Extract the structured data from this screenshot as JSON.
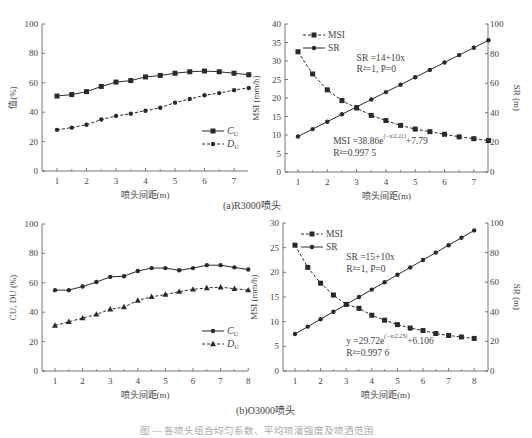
{
  "figure": {
    "caption_a": "(a)R3000喷头",
    "caption_b": "(b)O3000喷头",
    "caption_main": "图 — 各喷头组合均匀系数、平均喷灌强度及喷洒范围"
  },
  "chart_data": [
    {
      "id": "a-left",
      "type": "line",
      "panel": "(a)R3000喷头",
      "title": "",
      "xlabel": "喷头间距(m)",
      "ylabel": "值(%)",
      "xlim": [
        0.5,
        7.5
      ],
      "ylim": [
        0,
        100
      ],
      "xticks": [
        1,
        2,
        3,
        4,
        5,
        6,
        7
      ],
      "yticks": [
        0,
        20,
        40,
        60,
        80,
        100
      ],
      "grid": false,
      "legend_position": "lower right",
      "x": [
        1,
        1.5,
        2,
        2.5,
        3,
        3.5,
        4,
        4.5,
        5,
        5.5,
        6,
        6.5,
        7,
        7.5
      ],
      "series": [
        {
          "name": "CU",
          "label_main": "C",
          "label_sub": "U",
          "style": "solid",
          "marker": "square",
          "values": [
            51,
            52,
            54,
            57.5,
            60.5,
            61.5,
            64,
            65,
            66.5,
            67.5,
            68,
            67.5,
            66.5,
            65.5
          ]
        },
        {
          "name": "DU",
          "label_main": "D",
          "label_sub": "U",
          "style": "dashed",
          "marker": "dot",
          "values": [
            28,
            29.5,
            31.5,
            35,
            37.5,
            39,
            41,
            43,
            46.5,
            49,
            51.5,
            53,
            55,
            56.5
          ]
        }
      ]
    },
    {
      "id": "a-right",
      "type": "line",
      "panel": "(a)R3000喷头",
      "xlabel": "喷头间距(m)",
      "ylabel": "MSI (mm/h)",
      "y2label": "SR (m)",
      "xlim": [
        0.5,
        7.5
      ],
      "ylim": [
        0,
        40
      ],
      "y2lim": [
        0,
        100
      ],
      "xticks": [
        1,
        2,
        3,
        4,
        5,
        6,
        7
      ],
      "yticks": [
        0,
        5,
        10,
        15,
        20,
        25,
        30,
        35,
        40
      ],
      "y2ticks": [
        0,
        20,
        40,
        60,
        80,
        100
      ],
      "grid": false,
      "legend_position": "upper left",
      "x": [
        1,
        1.5,
        2,
        2.5,
        3,
        3.5,
        4,
        4.5,
        5,
        5.5,
        6,
        6.5,
        7,
        7.5
      ],
      "series": [
        {
          "name": "MSI",
          "axis": "left",
          "style": "dashed",
          "marker": "square",
          "values": [
            32.5,
            26.5,
            22.2,
            19.3,
            17.3,
            15.3,
            13.9,
            12.6,
            11.6,
            10.9,
            10.2,
            9.5,
            9.0,
            8.5
          ]
        },
        {
          "name": "SR",
          "axis": "right",
          "style": "solid",
          "marker": "dot",
          "values": [
            24,
            29,
            34,
            39,
            44,
            49,
            54,
            59,
            64,
            69,
            74,
            79,
            84,
            89
          ]
        }
      ],
      "annotations": [
        {
          "text": "SR =14+10x",
          "x": 3.0,
          "y": 30.0
        },
        {
          "text": "R²=1,  P=0",
          "x": 3.0,
          "y": 27.0
        },
        {
          "text": "MSI =38.86e^(−x/2.11)+7.79",
          "x": 2.2,
          "y": 7.5
        },
        {
          "text": "R²=0.997 5",
          "x": 2.2,
          "y": 4.2
        }
      ]
    },
    {
      "id": "b-left",
      "type": "line",
      "panel": "(b)O3000喷头",
      "xlabel": "喷头间距(m)",
      "ylabel": "CU, DU (%)",
      "xlim": [
        0.5,
        8
      ],
      "ylim": [
        0,
        100
      ],
      "xticks": [
        1,
        2,
        3,
        4,
        5,
        6,
        7,
        8
      ],
      "yticks": [
        0,
        20,
        40,
        60,
        80,
        100
      ],
      "grid": false,
      "legend_position": "lower right",
      "x": [
        1,
        1.5,
        2,
        2.5,
        3,
        3.5,
        4,
        4.5,
        5,
        5.5,
        6,
        6.5,
        7,
        7.5,
        8
      ],
      "series": [
        {
          "name": "CU",
          "label_main": "C",
          "label_sub": "U",
          "style": "solid",
          "marker": "dot",
          "values": [
            55,
            55,
            57.5,
            60.5,
            64,
            64.5,
            68,
            70,
            70,
            68.5,
            70,
            72,
            72,
            70.5,
            69
          ]
        },
        {
          "name": "DU",
          "label_main": "D",
          "label_sub": "U",
          "style": "dashed",
          "marker": "triangle",
          "values": [
            31,
            33.5,
            36,
            38.5,
            42,
            43.5,
            48,
            50.5,
            52,
            54,
            55.5,
            56.5,
            57,
            56,
            55
          ]
        }
      ]
    },
    {
      "id": "b-right",
      "type": "line",
      "panel": "(b)O3000喷头",
      "xlabel": "喷头间距(m)",
      "ylabel": "MSI (mm/h)",
      "y2label": "SR (m)",
      "xlim": [
        0.5,
        8.5
      ],
      "ylim": [
        0,
        30
      ],
      "y2lim": [
        0,
        100
      ],
      "xticks": [
        1,
        2,
        3,
        4,
        5,
        6,
        7,
        8
      ],
      "yticks": [
        0,
        5,
        10,
        15,
        20,
        25,
        30
      ],
      "y2ticks": [
        0,
        20,
        40,
        60,
        80,
        100
      ],
      "grid": false,
      "legend_position": "upper left",
      "x": [
        1,
        1.5,
        2,
        2.5,
        3,
        3.5,
        4,
        4.5,
        5,
        5.5,
        6,
        6.5,
        7,
        7.5,
        8
      ],
      "series": [
        {
          "name": "MSI",
          "axis": "left",
          "style": "dashed",
          "marker": "square",
          "values": [
            25.5,
            21.0,
            17.8,
            15.4,
            13.5,
            12.7,
            11.3,
            10.3,
            9.4,
            8.7,
            8.2,
            7.6,
            7.2,
            6.9,
            6.6
          ]
        },
        {
          "name": "SR",
          "axis": "right",
          "style": "solid",
          "marker": "dot",
          "values": [
            25,
            30,
            35,
            40,
            45,
            50,
            55,
            60,
            65,
            70,
            75,
            80,
            85,
            90,
            95
          ]
        }
      ],
      "annotations": [
        {
          "text": "SR =15+10x",
          "x": 3.0,
          "y": 22.5
        },
        {
          "text": "R²=1,  P=0",
          "x": 3.0,
          "y": 20.0
        },
        {
          "text": "y =29.72e^(−x/2.23)+6.106",
          "x": 3.0,
          "y": 5.5
        },
        {
          "text": "R²=0.997 6",
          "x": 3.0,
          "y": 3.0
        }
      ]
    }
  ],
  "layout": {
    "panels": [
      {
        "id": "a-left",
        "left": 42,
        "right": 248,
        "top": 24,
        "bottom": 171,
        "x_at_1": 57,
        "x_step": 29.5
      },
      {
        "id": "a-right",
        "left": 285,
        "right": 488,
        "top": 24,
        "bottom": 172,
        "x_at_1": 298,
        "x_step": 29.3
      },
      {
        "id": "b-left",
        "left": 42,
        "right": 248,
        "top": 224,
        "bottom": 371,
        "x_at_1": 55,
        "x_step": 27.6
      },
      {
        "id": "b-right",
        "left": 283,
        "right": 488,
        "top": 223,
        "bottom": 371,
        "x_at_1": 295,
        "x_step": 25.6
      }
    ],
    "line_color": "#2a2a2a",
    "axis_color": "#555555"
  }
}
